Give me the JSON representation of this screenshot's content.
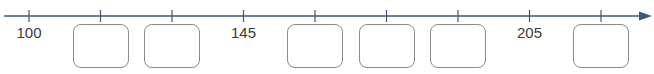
{
  "number_line": {
    "start": 100,
    "step": 15,
    "tick_count": 9,
    "color": "#3d5a7a",
    "ticks": [
      {
        "value": 100,
        "label": "100",
        "blank": false
      },
      {
        "value": 115,
        "label": "",
        "blank": true
      },
      {
        "value": 130,
        "label": "",
        "blank": true
      },
      {
        "value": 145,
        "label": "145",
        "blank": false
      },
      {
        "value": 160,
        "label": "",
        "blank": true
      },
      {
        "value": 175,
        "label": "",
        "blank": true
      },
      {
        "value": 190,
        "label": "",
        "blank": true
      },
      {
        "value": 205,
        "label": "205",
        "blank": false
      },
      {
        "value": 220,
        "label": "",
        "blank": true
      }
    ]
  }
}
